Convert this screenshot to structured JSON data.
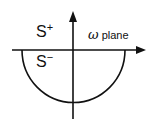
{
  "diagram": {
    "title": "ω plane",
    "labels": {
      "s_plus": {
        "base": "S",
        "sup": "+"
      },
      "s_minus": {
        "base": "S",
        "sup": "−"
      },
      "plane": {
        "symbol": "ω",
        "text": " plane"
      }
    },
    "elements": [
      "horizontal real axis with arrow",
      "vertical imaginary axis with arrow",
      "lower semicircle contour"
    ],
    "colors": {
      "stroke": "#111111",
      "background": "#ffffff"
    }
  }
}
